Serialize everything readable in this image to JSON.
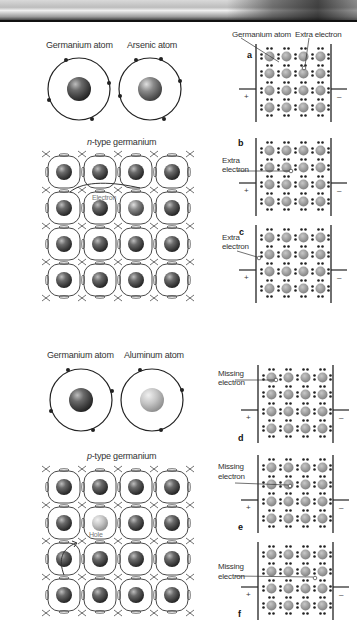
{
  "header": {
    "band": "decorative-photo-strip"
  },
  "ntype": {
    "atoms": [
      {
        "label": "Germanium atom",
        "core": "dark"
      },
      {
        "label": "Arsenic atom",
        "core": "medium"
      }
    ],
    "lattice_title_italic": "n",
    "lattice_title_rest": "-type germanium",
    "lattice_annotation": "Electron",
    "panels": [
      {
        "letter": "a",
        "label_1": "Germanium atom",
        "label_2": "Extra electron",
        "plus": "+",
        "minus": "–"
      },
      {
        "letter": "b",
        "label_1": "Extra",
        "label_2": "electron",
        "plus": "+",
        "minus": "–"
      },
      {
        "letter": "c",
        "label_1": "Extra",
        "label_2": "electron",
        "plus": "+",
        "minus": "–"
      }
    ]
  },
  "ptype": {
    "atoms": [
      {
        "label": "Germanium atom",
        "core": "dark"
      },
      {
        "label": "Aluminum atom",
        "core": "light"
      }
    ],
    "lattice_title_italic": "p",
    "lattice_title_rest": "-type germanium",
    "lattice_annotation": "Hole",
    "panels": [
      {
        "letter": "d",
        "label_1": "Missing",
        "label_2": "electron",
        "plus": "+",
        "minus": "–"
      },
      {
        "letter": "e",
        "label_1": "Missing",
        "label_2": "electron",
        "plus": "+",
        "minus": "–"
      },
      {
        "letter": "f",
        "label_1": "Missing",
        "label_2": "electron",
        "plus": "+",
        "minus": "–"
      }
    ]
  },
  "colors": {
    "line": "#222222",
    "core_dark": "#3a3a3a",
    "core_light": "#b5b5b5",
    "panel_atom": "#9a9a9a",
    "electron_dot": "#222222"
  }
}
